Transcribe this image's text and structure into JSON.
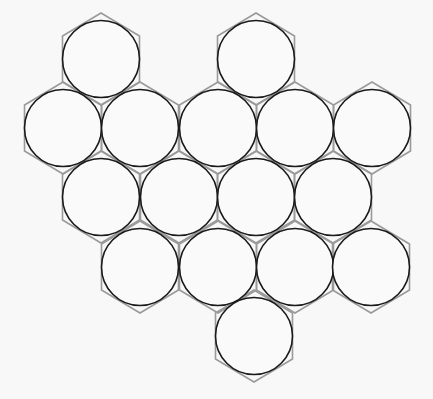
{
  "diagram": {
    "type": "circle-packing-honeycomb",
    "colors": {
      "background": "#f8f8f8",
      "circle_stroke": "#1a1a1a",
      "circle_fill": "#fafafa",
      "hex_stroke": "#9a9a9a"
    },
    "circle_radius": 38.5,
    "hex_vertical_scale": 1.035,
    "circles": [
      {
        "row": 0,
        "cx": 101,
        "cy": 59
      },
      {
        "row": 0,
        "cx": 256,
        "cy": 59
      },
      {
        "row": 1,
        "cx": 63,
        "cy": 128
      },
      {
        "row": 1,
        "cx": 140,
        "cy": 128
      },
      {
        "row": 1,
        "cx": 218,
        "cy": 128
      },
      {
        "row": 1,
        "cx": 295,
        "cy": 128
      },
      {
        "row": 1,
        "cx": 372,
        "cy": 128
      },
      {
        "row": 2,
        "cx": 101,
        "cy": 197
      },
      {
        "row": 2,
        "cx": 179,
        "cy": 197
      },
      {
        "row": 2,
        "cx": 256,
        "cy": 197
      },
      {
        "row": 2,
        "cx": 333,
        "cy": 197
      },
      {
        "row": 3,
        "cx": 140,
        "cy": 267
      },
      {
        "row": 3,
        "cx": 218,
        "cy": 267
      },
      {
        "row": 3,
        "cx": 295,
        "cy": 267
      },
      {
        "row": 3,
        "cx": 371,
        "cy": 267
      },
      {
        "row": 4,
        "cx": 254,
        "cy": 336
      }
    ],
    "hex_cells": [
      {
        "cx": 140,
        "cy": 59
      },
      {
        "cx": 218,
        "cy": 59
      },
      {
        "cx": 101,
        "cy": 128
      },
      {
        "cx": 179,
        "cy": 128
      },
      {
        "cx": 256,
        "cy": 128
      },
      {
        "cx": 333,
        "cy": 128
      },
      {
        "cx": 140,
        "cy": 197
      },
      {
        "cx": 218,
        "cy": 197
      },
      {
        "cx": 295,
        "cy": 197
      },
      {
        "cx": 179,
        "cy": 267
      },
      {
        "cx": 256,
        "cy": 267
      },
      {
        "cx": 333,
        "cy": 267
      }
    ]
  }
}
